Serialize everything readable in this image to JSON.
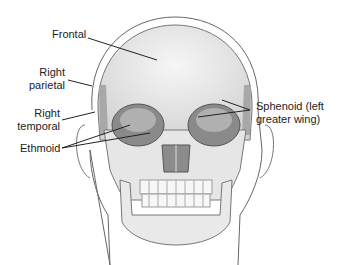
{
  "diagram": {
    "labels": {
      "frontal": "Frontal",
      "right_parietal_1": "Right",
      "right_parietal_2": "parietal",
      "right_temporal_1": "Right",
      "right_temporal_2": "temporal",
      "ethmoid": "Ethmoid",
      "sphenoid_1": "Sphenoid (left",
      "sphenoid_2": "greater wing)"
    },
    "colors": {
      "bone": "#ececec",
      "shade": "#9a9a9a",
      "outline": "#555555",
      "line": "#222222"
    }
  }
}
